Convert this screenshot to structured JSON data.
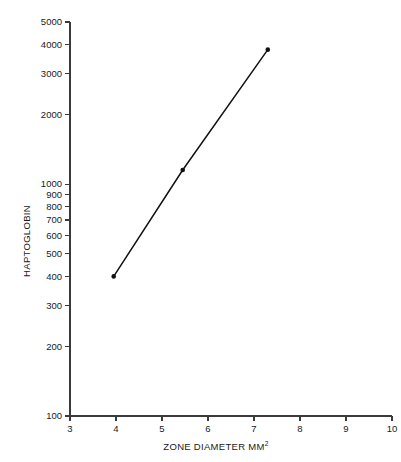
{
  "chart_data": {
    "type": "line",
    "title": "",
    "xlabel": "ZONE DIAMETER MM",
    "xlabel_superscript": "2",
    "ylabel": "HAPTOGLOBIN",
    "yscale": "log",
    "xscale": "linear",
    "xlim": [
      3,
      10
    ],
    "ylim": [
      100,
      5000
    ],
    "grid": false,
    "legend": null,
    "x_ticks": [
      3,
      4,
      5,
      6,
      7,
      8,
      9,
      10
    ],
    "x_tick_labels": [
      "3",
      "4",
      "5",
      "6",
      "7",
      "8",
      "9",
      "10"
    ],
    "y_ticks": [
      100,
      200,
      300,
      400,
      500,
      600,
      700,
      800,
      900,
      1000,
      2000,
      3000,
      4000,
      5000
    ],
    "y_tick_labels": [
      "100",
      "200",
      "300",
      "400",
      "500",
      "600",
      "700",
      "800",
      "900",
      "1000",
      "2000",
      "3000",
      "4000",
      "5000"
    ],
    "series": [
      {
        "name": "Haptoglobin standard curve",
        "marker": "filled-circle",
        "color": "#111111",
        "x": [
          3.95,
          5.45,
          7.3
        ],
        "y": [
          400,
          1150,
          3800
        ]
      }
    ]
  }
}
